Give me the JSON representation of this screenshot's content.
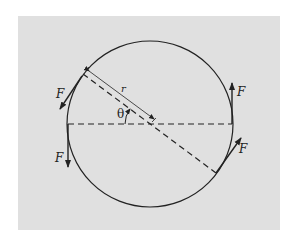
{
  "diagram": {
    "type": "physics-force-couple",
    "labels": {
      "radius": "r",
      "angle": "θ",
      "force_upper_left": "F",
      "force_lower_left": "F",
      "force_upper_right": "F",
      "force_lower_right": "F"
    },
    "colors": {
      "background": "#ffffff",
      "panel": "#e0e0e0",
      "ink": "#222222"
    }
  }
}
